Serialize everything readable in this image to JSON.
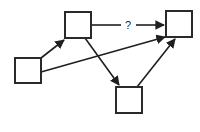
{
  "diagram": {
    "nodes": [
      {
        "id": "A",
        "label": "",
        "x": 15,
        "y": 58,
        "w": 26,
        "h": 25
      },
      {
        "id": "B",
        "label": "",
        "x": 65,
        "y": 12,
        "w": 26,
        "h": 26
      },
      {
        "id": "C",
        "label": "",
        "x": 166,
        "y": 11,
        "w": 26,
        "h": 26
      },
      {
        "id": "D",
        "label": "",
        "x": 116,
        "y": 87,
        "w": 26,
        "h": 26
      }
    ],
    "edges": [
      {
        "from": "A",
        "to": "B",
        "label": ""
      },
      {
        "from": "A",
        "to": "C",
        "label": ""
      },
      {
        "from": "B",
        "to": "C",
        "label": "?"
      },
      {
        "from": "B",
        "to": "D",
        "label": ""
      },
      {
        "from": "D",
        "to": "C",
        "label": ""
      }
    ],
    "unknown_edge_label": "?",
    "colors": {
      "stroke": "#1f1f1f",
      "background": "#ffffff"
    }
  }
}
